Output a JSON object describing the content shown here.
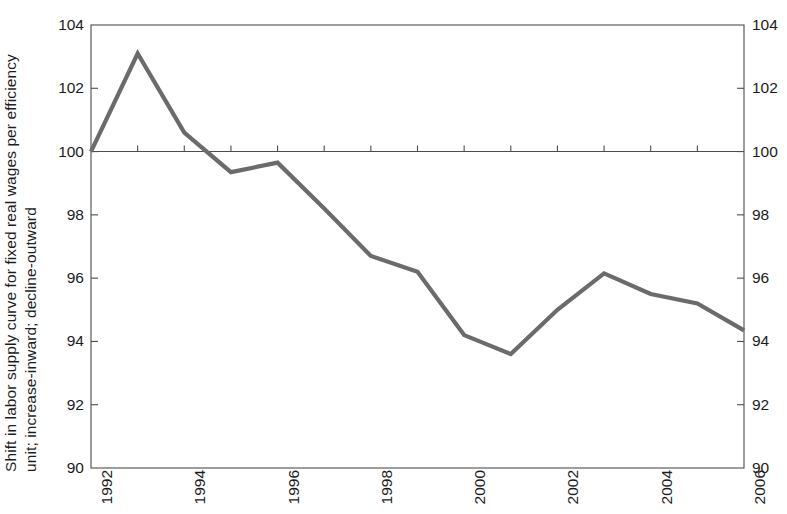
{
  "chart_data": {
    "type": "line",
    "title": "",
    "subtitle": "",
    "xlabel": "",
    "ylabel": "Shift in labor supply curve for fixed real wages per efficiency unit; increase-inward; decline-outward",
    "ylabel_lines": [
      "Shift in labor supply curve for fixed real wages per efficiency",
      "unit; increase-inward; decline-outward"
    ],
    "x": [
      1992,
      1993,
      1994,
      1995,
      1996,
      1997,
      1998,
      1999,
      2000,
      2001,
      2002,
      2003,
      2004,
      2005,
      2006
    ],
    "values": [
      100.0,
      103.1,
      100.6,
      99.35,
      99.65,
      98.2,
      96.7,
      96.2,
      94.2,
      93.6,
      95.0,
      96.15,
      95.5,
      95.2,
      94.35
    ],
    "series": [
      {
        "name": "Shift in labor supply curve",
        "color": "#6b6b6b",
        "values": [
          100.0,
          103.1,
          100.6,
          99.35,
          99.65,
          98.2,
          96.7,
          96.2,
          94.2,
          93.6,
          95.0,
          96.15,
          95.5,
          95.2,
          94.35
        ]
      }
    ],
    "xlim": [
      1992,
      2006
    ],
    "ylim": [
      90,
      104
    ],
    "xticks": [
      1992,
      1994,
      1996,
      1998,
      2000,
      2002,
      2004,
      2006
    ],
    "xtick_labels": [
      "1992",
      "1994",
      "1996",
      "1998",
      "2000",
      "2002",
      "2004",
      "2006"
    ],
    "xticks_minor": [
      1993,
      1995,
      1997,
      1999,
      2001,
      2003,
      2005
    ],
    "yticks": [
      90,
      92,
      94,
      96,
      98,
      100,
      102,
      104
    ],
    "ytick_labels_left": [
      "104",
      "102",
      "100",
      "98",
      "96",
      "94",
      "92",
      "90"
    ],
    "ytick_labels_right": [
      "104",
      "102",
      "100",
      "98",
      "96",
      "94",
      "92",
      "90"
    ],
    "grid": false,
    "legend": null,
    "legend_position": "none",
    "reference_line": {
      "value": 100,
      "label": ""
    },
    "axes": {
      "left_axis": true,
      "right_axis": true,
      "top_axis": true,
      "bottom_axis": true,
      "tick_direction": "out"
    },
    "annotations": [],
    "colors": {
      "line": "#6b6b6b",
      "axis": "#4d4d4d",
      "text": "#1c1c1c",
      "background": "#ffffff"
    }
  }
}
